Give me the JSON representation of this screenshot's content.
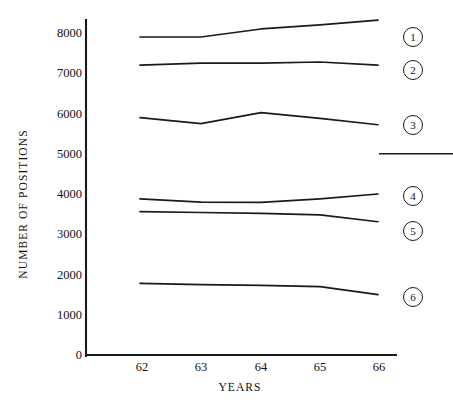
{
  "chart_data": {
    "type": "line",
    "title": "",
    "xlabel": "YEARS",
    "ylabel": "NUMBER OF POSITIONS",
    "categories": [
      "62",
      "63",
      "64",
      "65",
      "66"
    ],
    "xlim": [
      61.6,
      66.4
    ],
    "ylim": [
      0,
      8500
    ],
    "yticks": [
      0,
      1000,
      2000,
      3000,
      4000,
      5000,
      6000,
      7000,
      8000
    ],
    "ytick_labels": [
      "0",
      "1000",
      "2000",
      "3000",
      "4000",
      "5000",
      "6000",
      "7000",
      "8000"
    ],
    "grid": false,
    "legend_position": "right-inline-circled-numbers",
    "line_color": "#1a1a1a",
    "axis_color": "#1a1a1a",
    "background_color": "#ffffff",
    "series": [
      {
        "name": "1",
        "label": "1",
        "values": [
          7900,
          7900,
          8100,
          8200,
          8320
        ]
      },
      {
        "name": "2",
        "label": "2",
        "values": [
          7200,
          7250,
          7250,
          7280,
          7200
        ]
      },
      {
        "name": "3",
        "label": "3",
        "values": [
          5900,
          5750,
          6020,
          5880,
          5720
        ]
      },
      {
        "name": "4",
        "label": "4",
        "values": [
          3880,
          3800,
          3790,
          3880,
          4000
        ]
      },
      {
        "name": "5",
        "label": "5",
        "values": [
          3560,
          3540,
          3520,
          3480,
          3310
        ]
      },
      {
        "name": "6",
        "label": "6",
        "values": [
          1780,
          1750,
          1730,
          1700,
          1500
        ]
      }
    ],
    "annotations": [
      {
        "name": "rule-at-5000",
        "type": "horizontal-rule",
        "y": 5000,
        "x_start": 66.4,
        "x_end": 68.2
      }
    ]
  },
  "labels": {
    "y_axis_title": "NUMBER OF POSITIONS",
    "x_axis_title": "YEARS"
  },
  "badges": {
    "b1": "1",
    "b2": "2",
    "b3": "3",
    "b4": "4",
    "b5": "5",
    "b6": "6"
  }
}
